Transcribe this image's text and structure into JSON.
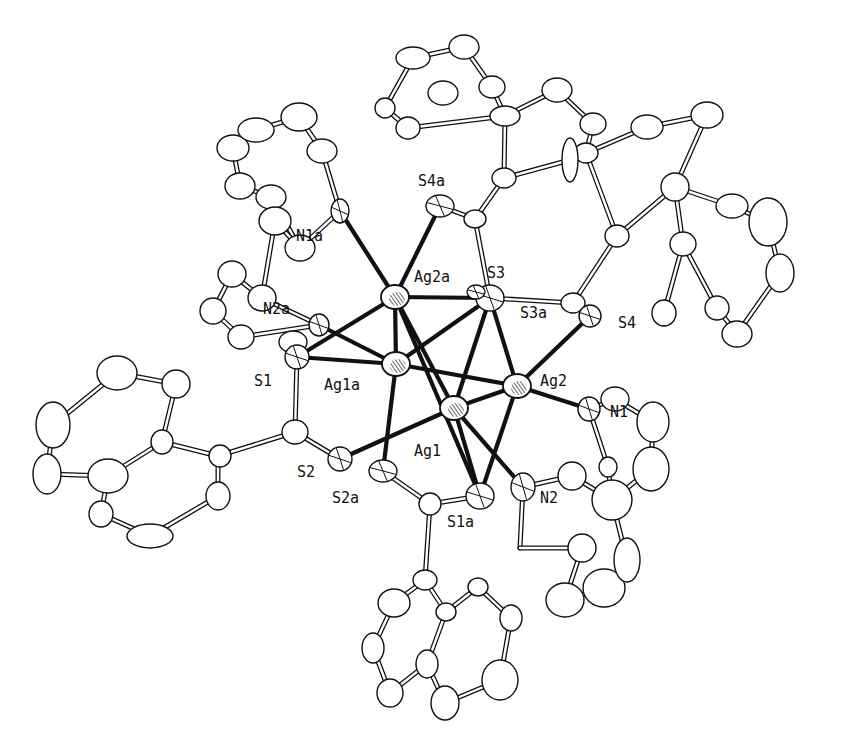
{
  "figure": {
    "type": "ORTEP molecular structure drawing",
    "colors": {
      "ink": "#111111",
      "background": "#ffffff"
    }
  },
  "labels": [
    {
      "id": "N1a",
      "text": "N1a",
      "x": 296,
      "y": 241
    },
    {
      "id": "S4a",
      "text": "S4a",
      "x": 418,
      "y": 186
    },
    {
      "id": "Ag2a",
      "text": "Ag2a",
      "x": 414,
      "y": 282
    },
    {
      "id": "S3",
      "text": "S3",
      "x": 487,
      "y": 278
    },
    {
      "id": "S3a",
      "text": "S3a",
      "x": 520,
      "y": 318
    },
    {
      "id": "S4",
      "text": "S4",
      "x": 618,
      "y": 328
    },
    {
      "id": "N2a",
      "text": "N2a",
      "x": 263,
      "y": 314
    },
    {
      "id": "S1",
      "text": "S1",
      "x": 254,
      "y": 386
    },
    {
      "id": "Ag1a",
      "text": "Ag1a",
      "x": 324,
      "y": 390
    },
    {
      "id": "Ag2",
      "text": "Ag2",
      "x": 540,
      "y": 386
    },
    {
      "id": "N1",
      "text": "N1",
      "x": 610,
      "y": 417
    },
    {
      "id": "Ag1",
      "text": "Ag1",
      "x": 414,
      "y": 456
    },
    {
      "id": "S2",
      "text": "S2",
      "x": 297,
      "y": 477
    },
    {
      "id": "S2a",
      "text": "S2a",
      "x": 332,
      "y": 503
    },
    {
      "id": "S1a",
      "text": "S1a",
      "x": 447,
      "y": 527
    },
    {
      "id": "N2",
      "text": "N2",
      "x": 540,
      "y": 503
    }
  ],
  "metal_atoms": [
    {
      "id": "Ag2a",
      "x": 395,
      "y": 297
    },
    {
      "id": "Ag1a",
      "x": 396,
      "y": 364
    },
    {
      "id": "Ag2",
      "x": 517,
      "y": 386
    },
    {
      "id": "Ag1",
      "x": 454,
      "y": 408
    }
  ],
  "hetero_atoms": [
    {
      "id": "S3",
      "x": 490,
      "y": 298,
      "rx": 14,
      "ry": 13
    },
    {
      "id": "S3a",
      "x": 476,
      "y": 292,
      "rx": 9,
      "ry": 7
    },
    {
      "id": "S4a",
      "x": 440,
      "y": 206,
      "rx": 14,
      "ry": 11
    },
    {
      "id": "S4",
      "x": 590,
      "y": 316,
      "rx": 11,
      "ry": 11
    },
    {
      "id": "S1",
      "x": 297,
      "y": 357,
      "rx": 12,
      "ry": 12
    },
    {
      "id": "S2",
      "x": 340,
      "y": 459,
      "rx": 12,
      "ry": 12
    },
    {
      "id": "S2a",
      "x": 383,
      "y": 471,
      "rx": 14,
      "ry": 11
    },
    {
      "id": "S1a",
      "x": 480,
      "y": 496,
      "rx": 14,
      "ry": 13
    },
    {
      "id": "N1a",
      "x": 340,
      "y": 211,
      "rx": 9,
      "ry": 12
    },
    {
      "id": "N2a",
      "x": 319,
      "y": 325,
      "rx": 10,
      "ry": 11
    },
    {
      "id": "N1",
      "x": 589,
      "y": 409,
      "rx": 11,
      "ry": 12
    },
    {
      "id": "N2",
      "x": 523,
      "y": 487,
      "rx": 12,
      "ry": 14
    }
  ],
  "carbon_atoms": [
    [
      233,
      148,
      16,
      13
    ],
    [
      256,
      130,
      18,
      12
    ],
    [
      299,
      117,
      18,
      14
    ],
    [
      322,
      151,
      15,
      12
    ],
    [
      271,
      197,
      15,
      12
    ],
    [
      240,
      186,
      15,
      13
    ],
    [
      275,
      221,
      16,
      14
    ],
    [
      300,
      248,
      15,
      13
    ],
    [
      262,
      298,
      14,
      13
    ],
    [
      232,
      274,
      14,
      13
    ],
    [
      213,
      311,
      13,
      13
    ],
    [
      241,
      337,
      13,
      12
    ],
    [
      413,
      58,
      17,
      11
    ],
    [
      464,
      47,
      15,
      12
    ],
    [
      492,
      87,
      13,
      11
    ],
    [
      443,
      93,
      15,
      12
    ],
    [
      408,
      128,
      12,
      11
    ],
    [
      385,
      108,
      10,
      10
    ],
    [
      505,
      116,
      15,
      10
    ],
    [
      557,
      90,
      15,
      12
    ],
    [
      593,
      124,
      13,
      11
    ],
    [
      504,
      178,
      12,
      10
    ],
    [
      475,
      219,
      11,
      9
    ],
    [
      586,
      153,
      12,
      10
    ],
    [
      570,
      160,
      8,
      22
    ],
    [
      647,
      127,
      16,
      12
    ],
    [
      707,
      115,
      16,
      13
    ],
    [
      675,
      187,
      14,
      14
    ],
    [
      617,
      236,
      12,
      11
    ],
    [
      683,
      244,
      13,
      12
    ],
    [
      732,
      206,
      16,
      12
    ],
    [
      768,
      222,
      19,
      24
    ],
    [
      780,
      273,
      14,
      19
    ],
    [
      737,
      334,
      15,
      13
    ],
    [
      717,
      308,
      12,
      12
    ],
    [
      664,
      313,
      12,
      13
    ],
    [
      573,
      303,
      12,
      10
    ],
    [
      293,
      342,
      14,
      11
    ],
    [
      117,
      373,
      20,
      17
    ],
    [
      176,
      384,
      14,
      14
    ],
    [
      53,
      425,
      17,
      23
    ],
    [
      162,
      442,
      11,
      12
    ],
    [
      220,
      456,
      11,
      11
    ],
    [
      47,
      474,
      14,
      20
    ],
    [
      108,
      476,
      20,
      17
    ],
    [
      218,
      496,
      12,
      14
    ],
    [
      101,
      514,
      12,
      13
    ],
    [
      150,
      536,
      23,
      12
    ],
    [
      295,
      432,
      13,
      12
    ],
    [
      430,
      504,
      11,
      11
    ],
    [
      425,
      580,
      12,
      10
    ],
    [
      394,
      603,
      16,
      14
    ],
    [
      478,
      587,
      10,
      9
    ],
    [
      511,
      618,
      11,
      13
    ],
    [
      446,
      612,
      10,
      9
    ],
    [
      373,
      648,
      11,
      15
    ],
    [
      427,
      664,
      11,
      14
    ],
    [
      500,
      680,
      18,
      20
    ],
    [
      390,
      693,
      13,
      14
    ],
    [
      445,
      703,
      14,
      17
    ],
    [
      582,
      548,
      14,
      14
    ],
    [
      565,
      600,
      19,
      17
    ],
    [
      604,
      588,
      21,
      19
    ],
    [
      627,
      560,
      13,
      22
    ],
    [
      612,
      500,
      20,
      20
    ],
    [
      572,
      476,
      14,
      14
    ],
    [
      615,
      399,
      14,
      12
    ],
    [
      653,
      422,
      16,
      20
    ],
    [
      651,
      469,
      18,
      22
    ],
    [
      608,
      467,
      9,
      10
    ]
  ],
  "metal_bonds": [
    [
      "Ag2a",
      "N1a"
    ],
    [
      "Ag2a",
      "S4a"
    ],
    [
      "Ag2a",
      "S3"
    ],
    [
      "Ag2a",
      "S1"
    ],
    [
      "Ag2a",
      "Ag1a"
    ],
    [
      "Ag2a",
      "Ag1"
    ],
    [
      "Ag2a",
      "S1a"
    ],
    [
      "Ag1a",
      "S1"
    ],
    [
      "Ag1a",
      "N2a"
    ],
    [
      "Ag1a",
      "S3"
    ],
    [
      "Ag1a",
      "Ag2"
    ],
    [
      "Ag1a",
      "S2a"
    ],
    [
      "Ag2",
      "S3"
    ],
    [
      "Ag2",
      "S4"
    ],
    [
      "Ag2",
      "N1"
    ],
    [
      "Ag2",
      "Ag1"
    ],
    [
      "Ag2",
      "S1a"
    ],
    [
      "Ag1",
      "S3"
    ],
    [
      "Ag1",
      "S2"
    ],
    [
      "Ag1",
      "S1a"
    ],
    [
      "Ag1",
      "N2"
    ]
  ],
  "organic_bonds": [
    [
      [
        340,
        211
      ],
      [
        322,
        151
      ]
    ],
    [
      [
        340,
        211
      ],
      [
        300,
        248
      ]
    ],
    [
      [
        322,
        151
      ],
      [
        299,
        117
      ]
    ],
    [
      [
        299,
        117
      ],
      [
        256,
        130
      ]
    ],
    [
      [
        256,
        130
      ],
      [
        233,
        148
      ]
    ],
    [
      [
        233,
        148
      ],
      [
        240,
        186
      ]
    ],
    [
      [
        240,
        186
      ],
      [
        271,
        197
      ]
    ],
    [
      [
        271,
        197
      ],
      [
        300,
        248
      ]
    ],
    [
      [
        300,
        248
      ],
      [
        275,
        221
      ]
    ],
    [
      [
        275,
        221
      ],
      [
        262,
        298
      ]
    ],
    [
      [
        262,
        298
      ],
      [
        232,
        274
      ]
    ],
    [
      [
        232,
        274
      ],
      [
        213,
        311
      ]
    ],
    [
      [
        213,
        311
      ],
      [
        241,
        337
      ]
    ],
    [
      [
        241,
        337
      ],
      [
        319,
        325
      ]
    ],
    [
      [
        319,
        325
      ],
      [
        262,
        298
      ]
    ],
    [
      [
        440,
        206
      ],
      [
        475,
        219
      ]
    ],
    [
      [
        475,
        219
      ],
      [
        490,
        298
      ]
    ],
    [
      [
        475,
        219
      ],
      [
        504,
        178
      ]
    ],
    [
      [
        504,
        178
      ],
      [
        570,
        160
      ]
    ],
    [
      [
        504,
        178
      ],
      [
        505,
        116
      ]
    ],
    [
      [
        505,
        116
      ],
      [
        492,
        87
      ]
    ],
    [
      [
        492,
        87
      ],
      [
        464,
        47
      ]
    ],
    [
      [
        464,
        47
      ],
      [
        413,
        58
      ]
    ],
    [
      [
        413,
        58
      ],
      [
        385,
        108
      ]
    ],
    [
      [
        385,
        108
      ],
      [
        408,
        128
      ]
    ],
    [
      [
        408,
        128
      ],
      [
        505,
        116
      ]
    ],
    [
      [
        505,
        116
      ],
      [
        557,
        90
      ]
    ],
    [
      [
        557,
        90
      ],
      [
        593,
        124
      ]
    ],
    [
      [
        593,
        124
      ],
      [
        586,
        153
      ]
    ],
    [
      [
        586,
        153
      ],
      [
        570,
        160
      ]
    ],
    [
      [
        490,
        298
      ],
      [
        573,
        303
      ]
    ],
    [
      [
        573,
        303
      ],
      [
        590,
        316
      ]
    ],
    [
      [
        573,
        303
      ],
      [
        617,
        236
      ]
    ],
    [
      [
        617,
        236
      ],
      [
        586,
        153
      ]
    ],
    [
      [
        586,
        153
      ],
      [
        647,
        127
      ]
    ],
    [
      [
        647,
        127
      ],
      [
        707,
        115
      ]
    ],
    [
      [
        707,
        115
      ],
      [
        675,
        187
      ]
    ],
    [
      [
        617,
        236
      ],
      [
        675,
        187
      ]
    ],
    [
      [
        675,
        187
      ],
      [
        732,
        206
      ]
    ],
    [
      [
        732,
        206
      ],
      [
        768,
        222
      ]
    ],
    [
      [
        768,
        222
      ],
      [
        780,
        273
      ]
    ],
    [
      [
        780,
        273
      ],
      [
        737,
        334
      ]
    ],
    [
      [
        737,
        334
      ],
      [
        717,
        308
      ]
    ],
    [
      [
        717,
        308
      ],
      [
        683,
        244
      ]
    ],
    [
      [
        683,
        244
      ],
      [
        675,
        187
      ]
    ],
    [
      [
        683,
        244
      ],
      [
        664,
        313
      ]
    ],
    [
      [
        297,
        357
      ],
      [
        293,
        342
      ]
    ],
    [
      [
        297,
        357
      ],
      [
        295,
        432
      ]
    ],
    [
      [
        295,
        432
      ],
      [
        340,
        459
      ]
    ],
    [
      [
        295,
        432
      ],
      [
        218,
        456
      ]
    ],
    [
      [
        218,
        456
      ],
      [
        162,
        442
      ]
    ],
    [
      [
        162,
        442
      ],
      [
        176,
        384
      ]
    ],
    [
      [
        176,
        384
      ],
      [
        117,
        373
      ]
    ],
    [
      [
        117,
        373
      ],
      [
        53,
        425
      ]
    ],
    [
      [
        53,
        425
      ],
      [
        47,
        474
      ]
    ],
    [
      [
        47,
        474
      ],
      [
        108,
        476
      ]
    ],
    [
      [
        108,
        476
      ],
      [
        162,
        442
      ]
    ],
    [
      [
        108,
        476
      ],
      [
        101,
        514
      ]
    ],
    [
      [
        101,
        514
      ],
      [
        150,
        536
      ]
    ],
    [
      [
        150,
        536
      ],
      [
        218,
        496
      ]
    ],
    [
      [
        218,
        496
      ],
      [
        218,
        456
      ]
    ],
    [
      [
        383,
        471
      ],
      [
        430,
        504
      ]
    ],
    [
      [
        430,
        504
      ],
      [
        480,
        496
      ]
    ],
    [
      [
        430,
        504
      ],
      [
        425,
        580
      ]
    ],
    [
      [
        425,
        580
      ],
      [
        394,
        603
      ]
    ],
    [
      [
        425,
        580
      ],
      [
        446,
        612
      ]
    ],
    [
      [
        446,
        612
      ],
      [
        478,
        587
      ]
    ],
    [
      [
        478,
        587
      ],
      [
        511,
        618
      ]
    ],
    [
      [
        511,
        618
      ],
      [
        500,
        680
      ]
    ],
    [
      [
        500,
        680
      ],
      [
        445,
        703
      ]
    ],
    [
      [
        445,
        703
      ],
      [
        427,
        664
      ]
    ],
    [
      [
        427,
        664
      ],
      [
        446,
        612
      ]
    ],
    [
      [
        427,
        664
      ],
      [
        390,
        693
      ]
    ],
    [
      [
        390,
        693
      ],
      [
        373,
        648
      ]
    ],
    [
      [
        373,
        648
      ],
      [
        394,
        603
      ]
    ],
    [
      [
        523,
        487
      ],
      [
        572,
        476
      ]
    ],
    [
      [
        523,
        487
      ],
      [
        520,
        548
      ]
    ],
    [
      [
        520,
        548
      ],
      [
        582,
        548
      ]
    ],
    [
      [
        582,
        548
      ],
      [
        565,
        600
      ]
    ],
    [
      [
        565,
        600
      ],
      [
        604,
        588
      ]
    ],
    [
      [
        604,
        588
      ],
      [
        627,
        560
      ]
    ],
    [
      [
        627,
        560
      ],
      [
        612,
        500
      ]
    ],
    [
      [
        612,
        500
      ],
      [
        572,
        476
      ]
    ],
    [
      [
        589,
        409
      ],
      [
        615,
        399
      ]
    ],
    [
      [
        615,
        399
      ],
      [
        653,
        422
      ]
    ],
    [
      [
        653,
        422
      ],
      [
        651,
        469
      ]
    ],
    [
      [
        651,
        469
      ],
      [
        612,
        500
      ]
    ],
    [
      [
        612,
        500
      ],
      [
        608,
        467
      ]
    ],
    [
      [
        608,
        467
      ],
      [
        589,
        409
      ]
    ]
  ]
}
